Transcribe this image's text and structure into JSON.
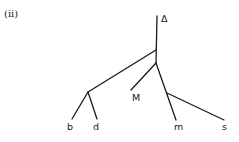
{
  "figure": {
    "label": "(ii)",
    "type": "tree"
  },
  "tree": {
    "root_label": "Δ",
    "leaves": [
      {
        "id": "b",
        "label": "b"
      },
      {
        "id": "d",
        "label": "d"
      },
      {
        "id": "M",
        "label": "M"
      },
      {
        "id": "m",
        "label": "m"
      },
      {
        "id": "s",
        "label": "s"
      }
    ],
    "structure": "((b,d),(M,(m,s)))Δ"
  }
}
